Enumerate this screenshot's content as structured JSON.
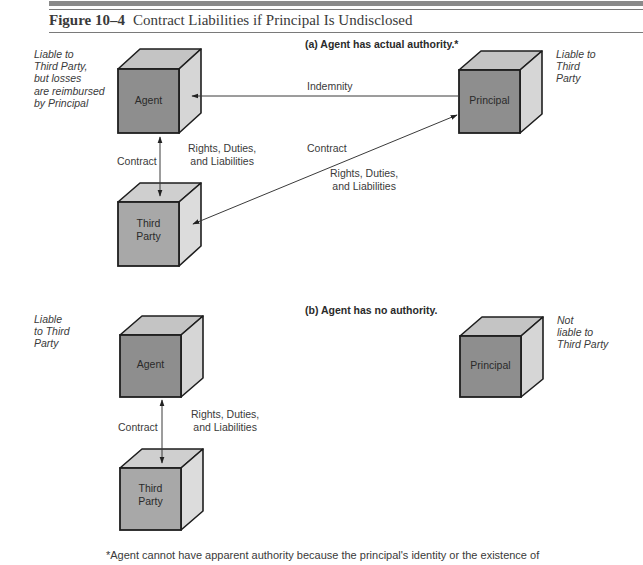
{
  "figure": {
    "number": "Figure 10–4",
    "title": "Contract Liabilities if Principal Is Undisclosed"
  },
  "panel_a": {
    "heading": "(a) Agent has actual authority.*",
    "agent_note": [
      "Liable to",
      "Third Party,",
      "but losses",
      "are reimbursed",
      "by Principal"
    ],
    "principal_note": [
      "Liable to",
      "Third",
      "Party"
    ],
    "boxes": {
      "agent": "Agent",
      "principal": "Principal",
      "third_party": [
        "Third",
        "Party"
      ]
    },
    "arrows": {
      "indemnity": "Indemnity",
      "agent_third_contract": "Contract",
      "agent_third_rights": [
        "Rights, Duties,",
        "and Liabilities"
      ],
      "principal_third_contract": "Contract",
      "principal_third_rights": [
        "Rights, Duties,",
        "and Liabilities"
      ]
    }
  },
  "panel_b": {
    "heading": "(b) Agent has no authority.",
    "agent_note": [
      "Liable",
      "to Third",
      "Party"
    ],
    "principal_note": [
      "Not",
      "liable to",
      "Third Party"
    ],
    "boxes": {
      "agent": "Agent",
      "principal": "Principal",
      "third_party": [
        "Third",
        "Party"
      ]
    },
    "arrows": {
      "agent_third_contract": "Contract",
      "agent_third_rights": [
        "Rights, Duties,",
        "and Liabilities"
      ]
    }
  },
  "footnote": "*Agent cannot have apparent authority because the principal's identity or the existence of",
  "colors": {
    "front_face": "#8e8e8e",
    "top_face": "#c4c4c4",
    "side_face": "#d6d6d6",
    "edge": "#1e1e1e",
    "line": "#3a3a3a"
  }
}
